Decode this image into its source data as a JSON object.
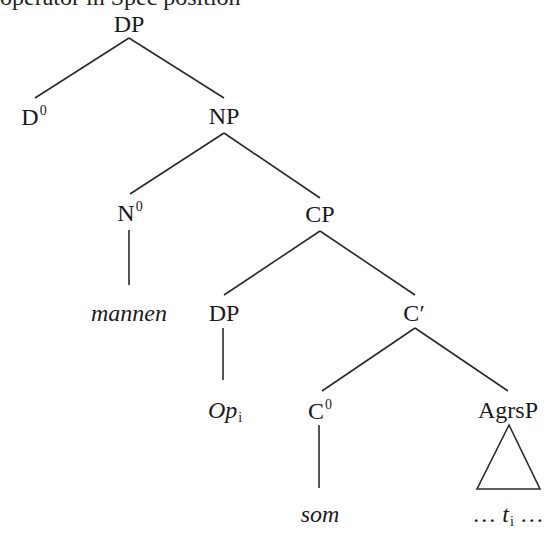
{
  "caption": {
    "clipped_text": "operator in Spec position"
  },
  "tree": {
    "line_color": "#2a2a2a",
    "nodes": {
      "root": {
        "label": "DP"
      },
      "d0": {
        "label": "D",
        "sup": "0"
      },
      "np": {
        "label": "NP"
      },
      "n0": {
        "label": "N",
        "sup": "0"
      },
      "mannen": {
        "label": "mannen"
      },
      "cp": {
        "label": "CP"
      },
      "dp_spec": {
        "label": "DP"
      },
      "op": {
        "label": "Op",
        "sub": "i"
      },
      "cbar": {
        "label": "C′"
      },
      "c0": {
        "label": "C",
        "sup": "0"
      },
      "som": {
        "label": "som"
      },
      "agrsp": {
        "label": "AgrsP"
      },
      "trace": {
        "prefix": "… ",
        "label": "t",
        "sub": "i",
        "suffix": " …"
      }
    }
  }
}
